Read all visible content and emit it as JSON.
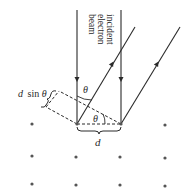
{
  "diagram": {
    "beam_label_lines": [
      "incident",
      "electron",
      "beam"
    ],
    "theta_symbol": "θ",
    "path_difference_label": "d sinθ",
    "path_difference_d": "d",
    "path_difference_sin": "sin",
    "spacing_label": "d",
    "colors": {
      "line": "#2a2a2a",
      "dot": "#555555",
      "background": "#ffffff"
    }
  }
}
